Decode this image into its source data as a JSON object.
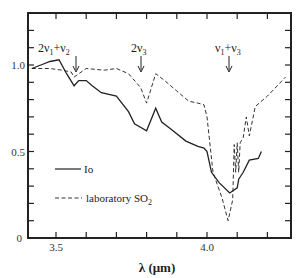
{
  "chart_data": {
    "type": "line",
    "title": "",
    "xlabel": "λ (μm)",
    "ylabel": "",
    "xlim": [
      3.407,
      4.278
    ],
    "ylim": [
      0,
      1.3
    ],
    "grid": false,
    "legend_position": "inside-left",
    "x_ticks": [
      3.5,
      3.6,
      3.7,
      3.8,
      3.9,
      4.0,
      4.1,
      4.2
    ],
    "x_tick_labels": [
      "3.5",
      "4.0"
    ],
    "y_ticks": [
      0,
      0.1,
      0.2,
      0.3,
      0.4,
      0.5,
      0.6,
      0.7,
      0.8,
      0.9,
      1.0,
      1.1,
      1.2
    ],
    "y_tick_labels": [
      "0",
      "0.5",
      "1.0"
    ],
    "annotations": [
      {
        "text": "2ν₁+ν₂",
        "x": 3.56,
        "arrow_to_y": 0.93
      },
      {
        "text": "2ν₃",
        "x": 3.8,
        "arrow_to_y": 0.81
      },
      {
        "text": "ν₁+ν₃",
        "x": 4.08,
        "arrow_to_y": 0.83
      }
    ],
    "series": [
      {
        "name": "Io",
        "style": "solid",
        "x": [
          3.42,
          3.45,
          3.48,
          3.51,
          3.535,
          3.56,
          3.575,
          3.6,
          3.62,
          3.65,
          3.7,
          3.74,
          3.76,
          3.8,
          3.83,
          3.85,
          3.88,
          3.93,
          3.97,
          3.99,
          4.0,
          4.015,
          4.04,
          4.075,
          4.1,
          4.105,
          4.12,
          4.14,
          4.17,
          4.18
        ],
        "y": [
          0.98,
          1.0,
          1.02,
          1.03,
          0.95,
          0.88,
          0.91,
          0.91,
          0.88,
          0.84,
          0.82,
          0.73,
          0.66,
          0.62,
          0.75,
          0.67,
          0.63,
          0.56,
          0.53,
          0.52,
          0.5,
          0.38,
          0.32,
          0.26,
          0.29,
          0.34,
          0.38,
          0.45,
          0.46,
          0.5
        ]
      },
      {
        "name": "laboratory SO₂",
        "style": "dashed",
        "x": [
          3.42,
          3.48,
          3.52,
          3.55,
          3.56,
          3.6,
          3.66,
          3.7,
          3.74,
          3.78,
          3.8,
          3.83,
          3.86,
          3.9,
          3.94,
          3.97,
          3.99,
          4.0,
          4.02,
          4.05,
          4.07,
          4.085,
          4.09,
          4.095,
          4.1,
          4.105,
          4.11,
          4.12,
          4.13,
          4.14,
          4.16,
          4.2,
          4.26
        ],
        "y": [
          0.98,
          0.98,
          0.97,
          0.96,
          0.93,
          0.98,
          0.97,
          0.98,
          0.95,
          0.87,
          0.78,
          0.95,
          0.91,
          0.85,
          0.79,
          0.78,
          0.77,
          0.7,
          0.38,
          0.23,
          0.1,
          0.22,
          0.54,
          0.38,
          0.55,
          0.38,
          0.55,
          0.58,
          0.7,
          0.59,
          0.76,
          0.82,
          0.93
        ]
      }
    ]
  },
  "legend": {
    "io_label": "Io",
    "so2_label": "laboratory SO",
    "so2_subscript": "2"
  },
  "labels": {
    "y_0": "0",
    "y_05": "0.5",
    "y_10": "1.0",
    "x_35": "3.5",
    "x_40": "4.0",
    "xlabel": "λ (μm)",
    "annot1_main": "2ν",
    "annot1_sub": "1",
    "annot1_tail": "+ν",
    "annot1_sub2": "2",
    "annot2_main": "2ν",
    "annot2_sub": "3",
    "annot3_main": "ν",
    "annot3_sub": "1",
    "annot3_tail": "+ν",
    "annot3_sub2": "3"
  }
}
